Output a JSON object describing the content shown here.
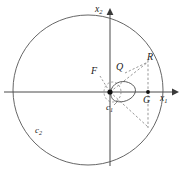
{
  "figure": {
    "kind": "geometry-diagram",
    "background_color": "#ffffff",
    "stroke_color": "#3a3a3a",
    "label_color": "#1a1a1a",
    "axes": {
      "horizontal": {
        "name": "x",
        "subscript": "1",
        "label": "x"
      },
      "vertical": {
        "name": "x",
        "subscript": "2",
        "label": "x"
      },
      "origin_label": ""
    },
    "points": [
      {
        "id": "F",
        "label": "F",
        "marker": "none"
      },
      {
        "id": "Q",
        "label": "Q",
        "marker": "none"
      },
      {
        "id": "R",
        "label": "R",
        "marker": "none"
      },
      {
        "id": "G",
        "label": "G",
        "marker": "dot"
      }
    ],
    "curves": [
      {
        "id": "c1",
        "label": "c",
        "subscript": "1",
        "style": "solid"
      },
      {
        "id": "c2",
        "label": "c",
        "subscript": "2",
        "style": "solid"
      }
    ],
    "axis_subscripts": {
      "horizontal": "1",
      "vertical": "2"
    }
  }
}
